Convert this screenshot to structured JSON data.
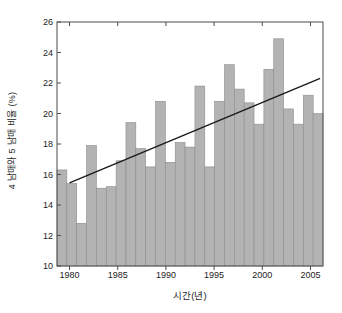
{
  "chart_data": {
    "type": "bar",
    "title": "",
    "subtitle": "",
    "xlabel": "시간(년)",
    "ylabel": "4 남매와 5 남매 비율 (%)",
    "xlim": [
      1979.2,
      2006.8
    ],
    "ylim": [
      10,
      26
    ],
    "yticks": [
      10,
      12,
      14,
      16,
      18,
      20,
      22,
      24,
      26
    ],
    "xticks": [
      1980,
      1985,
      1990,
      1995,
      2000,
      2005
    ],
    "grid": false,
    "legend": null,
    "bar_color": "#b3b3b3",
    "bar_edge_color": "#8c8c8c",
    "line_color": "#1a1a1a",
    "axis_color": "#4d4d4d",
    "categories": [
      1980,
      1981,
      1982,
      1983,
      1984,
      1985,
      1986,
      1987,
      1988,
      1989,
      1990,
      1991,
      1992,
      1993,
      1994,
      1995,
      1996,
      1997,
      1998,
      1999,
      2000,
      2001,
      2002,
      2003,
      2004,
      2005,
      2006
    ],
    "values": [
      16.3,
      15.4,
      12.8,
      17.9,
      15.1,
      15.2,
      16.9,
      19.4,
      17.7,
      16.5,
      20.8,
      16.8,
      18.1,
      17.8,
      21.8,
      16.5,
      20.8,
      23.2,
      21.6,
      20.7,
      19.3,
      22.9,
      24.9,
      20.3,
      19.3,
      21.2,
      20.0
    ],
    "series": [
      {
        "name": "비율",
        "type": "bar",
        "values": [
          16.3,
          15.4,
          12.8,
          17.9,
          15.1,
          15.2,
          16.9,
          19.4,
          17.7,
          16.5,
          20.8,
          16.8,
          18.1,
          17.8,
          21.8,
          16.5,
          20.8,
          23.2,
          21.6,
          20.7,
          19.3,
          22.9,
          24.9,
          20.3,
          19.3,
          21.2,
          20.0
        ]
      },
      {
        "name": "추세선",
        "type": "line",
        "x": [
          1980,
          2006
        ],
        "y": [
          15.45,
          22.3
        ]
      }
    ],
    "ytick_labels": [
      "10",
      "12",
      "14",
      "16",
      "18",
      "20",
      "22",
      "24",
      "26"
    ],
    "xtick_labels": [
      "1980",
      "1985",
      "1990",
      "1995",
      "2000",
      "2005"
    ]
  }
}
